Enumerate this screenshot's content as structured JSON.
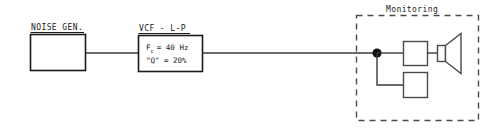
{
  "diagram": {
    "title": "",
    "blocks": {
      "noise_gen": {
        "label": "NOISE GEN.",
        "body": ""
      },
      "vcf": {
        "label": "VCF - L-P",
        "param1_symbol": "F",
        "param1_subscript": "c",
        "param1_rest": "= 40 Hz",
        "param2": "\"Q\" = 20%"
      },
      "monitoring": {
        "label": "Monitoring",
        "amp_box": "",
        "aux_box": "",
        "speaker": ""
      }
    },
    "colors": {
      "ink": "#1a1a1a",
      "wire": "#3a3a3a",
      "dash": "#4a4a4a",
      "background": "#ffffff"
    }
  }
}
